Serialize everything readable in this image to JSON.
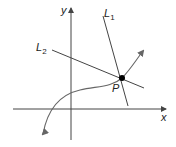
{
  "axes": {
    "x_label": "x",
    "y_label": "y"
  },
  "lines": [
    {
      "name": "L",
      "subscript": "1"
    },
    {
      "name": "L",
      "subscript": "2"
    }
  ],
  "point": {
    "label": "P"
  },
  "colors": {
    "stroke": "#444444",
    "curve": "#666666",
    "point": "#000000"
  }
}
